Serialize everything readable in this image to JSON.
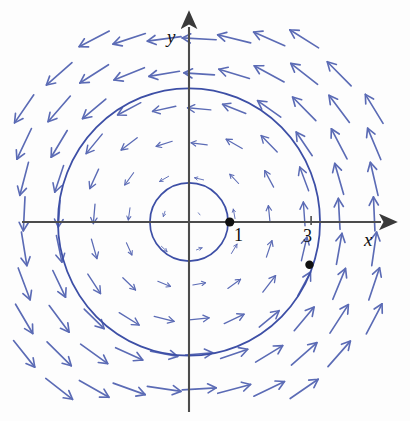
{
  "figure": {
    "background_color": "#fdfdfd",
    "width": 410,
    "height": 421
  },
  "axes": {
    "x_label": "x",
    "y_label": "y",
    "axis_color": "#4c4c4c",
    "origin_px": [
      189,
      222
    ],
    "unit_px": 40.7,
    "x_axis_span_px": [
      22,
      390
    ],
    "y_axis_span_px": [
      18,
      412
    ],
    "arrowheads": [
      "x-positive",
      "y-positive"
    ]
  },
  "ticks": {
    "x": [
      {
        "label": "1",
        "value": 1,
        "marker": "point"
      },
      {
        "label": "3",
        "value": 3,
        "marker": "tick"
      }
    ]
  },
  "markers": [
    {
      "name": "point-one-zero",
      "x": 1,
      "y": 0,
      "color": "#101010",
      "radius_px": 4.6
    },
    {
      "name": "point-on-outer-circle",
      "x": 2.96,
      "y": -1.05,
      "color": "#101010",
      "radius_px": 4.2
    }
  ],
  "chart_data": {
    "type": "scatter",
    "xlabel": "x",
    "ylabel": "y",
    "xlim": [
      -4.1,
      4.9
    ],
    "ylim": [
      -4.9,
      5.0
    ],
    "grid": false,
    "legend": "none",
    "field": {
      "formula": "F(x, y) = (-y, x)",
      "rotation": "counterclockwise",
      "magnitude_rule": "proportional to distance from origin",
      "sample_spacing_units": 0.86,
      "arrow_color": "#5b6bb5",
      "arrow_scale_px_per_unit": 13.5,
      "sample_grid_x": [
        -4.05,
        -3.19,
        -2.33,
        -1.47,
        -0.61,
        0.25,
        1.11,
        1.97,
        2.83,
        3.69,
        4.55
      ],
      "sample_grid_y": [
        4.5,
        3.64,
        2.78,
        1.92,
        1.06,
        0.2,
        -0.66,
        -1.52,
        -2.38,
        -3.24,
        -4.1
      ]
    },
    "curves": [
      {
        "name": "inner-circle",
        "shape": "circle",
        "center": [
          0,
          0
        ],
        "radius": 0.96,
        "color": "#3d4fa6",
        "stroke_px": 1.7
      },
      {
        "name": "outer-circle",
        "shape": "circle",
        "center": [
          0,
          0
        ],
        "radius": 3.22,
        "color": "#3d4fa6",
        "stroke_px": 1.8
      }
    ],
    "points": [
      {
        "x": 1,
        "y": 0,
        "label": "1"
      },
      {
        "x": 2.96,
        "y": -1.05,
        "label": ""
      }
    ]
  }
}
